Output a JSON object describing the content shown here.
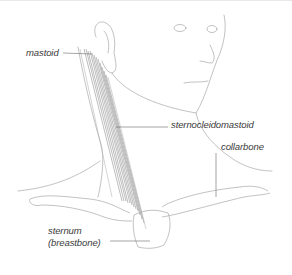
{
  "figure": {
    "labels": {
      "mastoid": "mastoid",
      "sternocleidomastoid": "sternocleidomastoid",
      "collarbone": "collarbone",
      "sternum_line1": "sternum",
      "sternum_line2": "(breastbone)"
    },
    "colors": {
      "line": "#9a9a9a",
      "muscle": "#7a7a7a",
      "text": "#3a3a3a",
      "background": "#ffffff"
    }
  }
}
